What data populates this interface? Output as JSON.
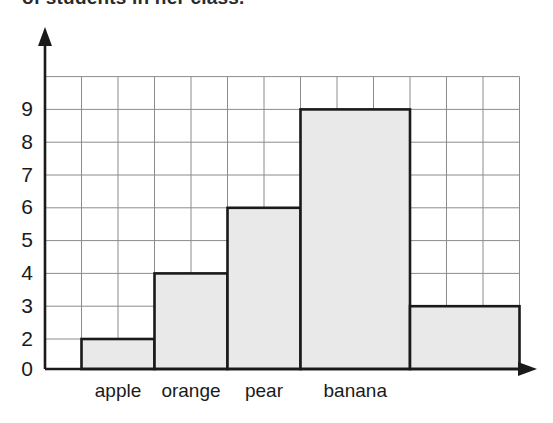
{
  "caption": {
    "text": "of students in her class."
  },
  "chart_data": {
    "type": "bar",
    "title": "",
    "subtitle": "",
    "xlabel": "",
    "ylabel": "",
    "categories": [
      "apple",
      "orange",
      "pear",
      "banana",
      ""
    ],
    "values": [
      2,
      4,
      6,
      9,
      3
    ],
    "bars": [
      {
        "label": "apple",
        "value": 2,
        "x0": 1,
        "x1": 3,
        "width_units": 2
      },
      {
        "label": "orange",
        "value": 4,
        "x0": 3,
        "x1": 5,
        "width_units": 2
      },
      {
        "label": "pear",
        "value": 6,
        "x0": 5,
        "x1": 7,
        "width_units": 2
      },
      {
        "label": "banana",
        "value": 9,
        "x0": 7,
        "x1": 10,
        "width_units": 3
      },
      {
        "label": "",
        "value": 3,
        "x0": 10,
        "x1": 13,
        "width_units": 3
      }
    ],
    "ylim": [
      0,
      10
    ],
    "yticks": [
      0,
      2,
      3,
      4,
      5,
      6,
      7,
      8,
      9
    ],
    "ytick_labels": [
      "0",
      "2",
      "3",
      "4",
      "5",
      "6",
      "7",
      "8",
      "9"
    ],
    "missing_ytick_label": "1",
    "grid": true,
    "grid_columns": 13,
    "legend": "none",
    "axis_arrows": {
      "y": "up",
      "x": "right"
    },
    "colors": {
      "bar_fill": "#e9e9e9",
      "bar_stroke": "#1a1a1a",
      "grid": "#8c8c8c",
      "axis": "#1a1a1a",
      "background": "#ffffff",
      "text": "#1a1a1a"
    }
  }
}
